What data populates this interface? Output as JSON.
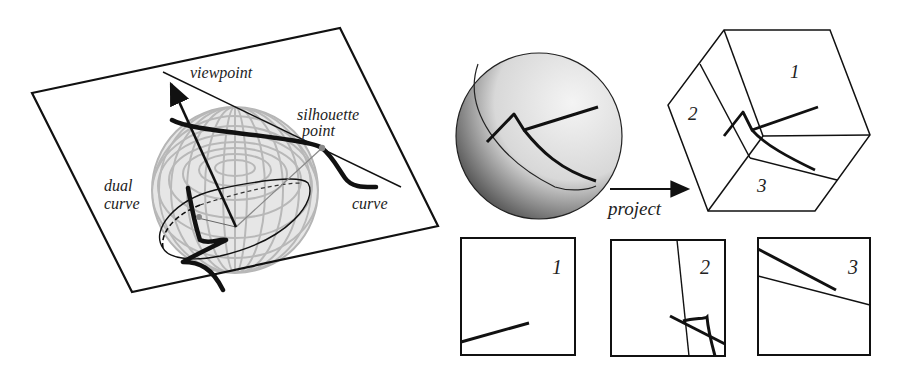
{
  "left_figure": {
    "labels": {
      "viewpoint": "viewpoint",
      "silhouette_line1": "silhouette",
      "silhouette_line2": "point",
      "dual_line1": "dual",
      "dual_line2": "curve",
      "curve": "curve"
    }
  },
  "right_figure": {
    "arrow_label": "project",
    "cube_faces": [
      "1",
      "2",
      "3"
    ],
    "panels": [
      {
        "label": "1"
      },
      {
        "label": "2"
      },
      {
        "label": "3"
      }
    ]
  },
  "colors": {
    "stroke": "#111111",
    "sphere_grid": "#bbbbbb",
    "silhouette_dot": "#888888"
  }
}
